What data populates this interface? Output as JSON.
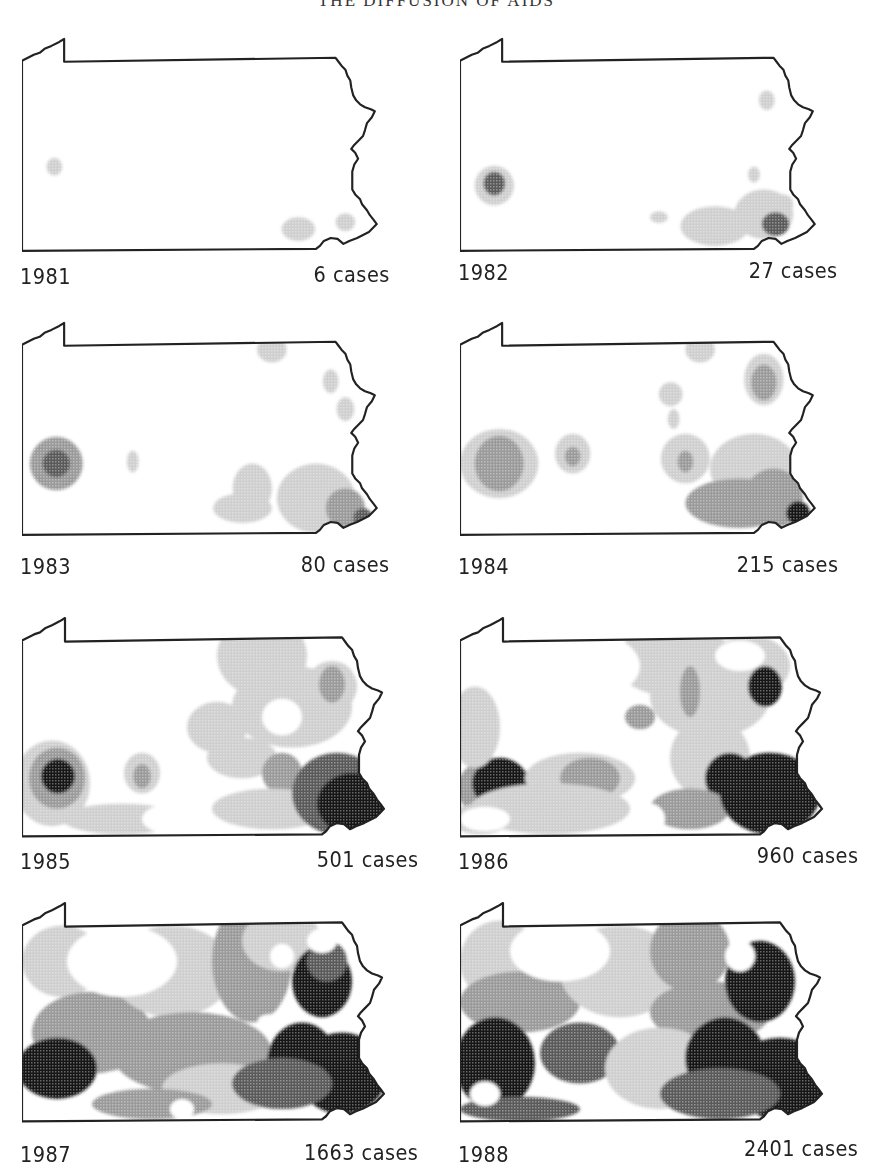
{
  "page": {
    "title": "THE DIFFUSION OF AIDS"
  },
  "maps": [
    {
      "year": "1981",
      "cases": "6 cases"
    },
    {
      "year": "1982",
      "cases": "27 cases"
    },
    {
      "year": "1983",
      "cases": "80 cases"
    },
    {
      "year": "1984",
      "cases": "215 cases"
    },
    {
      "year": "1985",
      "cases": "501 cases"
    },
    {
      "year": "1986",
      "cases": "960 cases"
    },
    {
      "year": "1987",
      "cases": "1663 cases"
    },
    {
      "year": "1988",
      "cases": "2401 cases"
    }
  ],
  "shading": {
    "none": "#ffffff",
    "light": "#cfcfcf",
    "medium": "#9a9a9a",
    "dark": "#5a5a5a",
    "black": "#141414",
    "outline": "#222222"
  },
  "chart_data": {
    "type": "heatmap",
    "title": "THE DIFFUSION OF AIDS",
    "subtitle": "Pennsylvania choropleth maps by year",
    "categories": [
      "1981",
      "1982",
      "1983",
      "1984",
      "1985",
      "1986",
      "1987",
      "1988"
    ],
    "values": [
      6,
      27,
      80,
      215,
      501,
      960,
      1663,
      2401
    ],
    "unit": "cases",
    "legend": [
      "white",
      "light gray",
      "medium gray",
      "dark gray",
      "black"
    ],
    "layout": {
      "rows": 4,
      "cols": 2
    }
  }
}
